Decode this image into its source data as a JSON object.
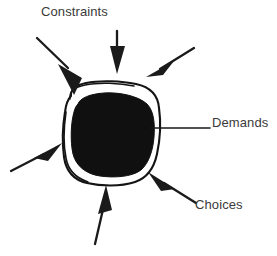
{
  "diagram": {
    "background_color": "#ffffff",
    "ink_color": "#1a1a1a",
    "text_color": "#3a3a3a",
    "labels": {
      "constraints": "Constraints",
      "demands": "Demands",
      "choices": "Choices"
    },
    "shape": {
      "name": "rounded-blob",
      "outline_color": "#141414",
      "fill_color": "#101010",
      "description": "Hand drawn rounded square outline with a solid black filled blob inside, separated by a white gap"
    },
    "arrows": [
      {
        "name": "arrow-top-left",
        "points_to": "blob-upper-left-edge",
        "direction": "down-right",
        "label": "Constraints"
      },
      {
        "name": "arrow-top-center",
        "points_to": "blob-top-edge",
        "direction": "down",
        "label": "Constraints"
      },
      {
        "name": "arrow-top-right",
        "points_to": "blob-upper-right-edge",
        "direction": "down-left",
        "label": "Constraints"
      },
      {
        "name": "arrow-left",
        "points_to": "blob-left-edge",
        "direction": "up-right",
        "label": ""
      },
      {
        "name": "arrow-bottom",
        "points_to": "blob-bottom-edge",
        "direction": "up-right",
        "label": ""
      },
      {
        "name": "arrow-bottom-right",
        "points_to": "blob-lower-right-edge",
        "direction": "up-left",
        "label": "Choices"
      }
    ],
    "leader_lines": [
      {
        "name": "leader-demands",
        "from": "blob-right-edge",
        "to": "Demands",
        "style": "horizontal-line"
      }
    ]
  }
}
